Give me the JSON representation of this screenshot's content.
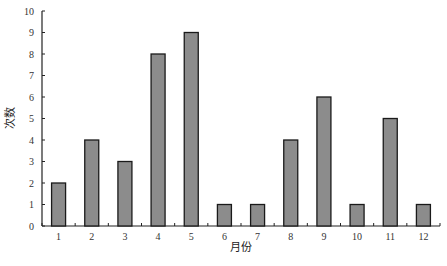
{
  "chart_data": {
    "type": "bar",
    "title": "",
    "xlabel": "月份",
    "ylabel": "次数",
    "categories": [
      "1",
      "2",
      "3",
      "4",
      "5",
      "6",
      "7",
      "8",
      "9",
      "10",
      "11",
      "12"
    ],
    "values": [
      2,
      4,
      3,
      8,
      9,
      1,
      1,
      4,
      6,
      1,
      5,
      1
    ],
    "ylim": [
      0,
      10
    ],
    "yticks": [
      0,
      1,
      2,
      3,
      4,
      5,
      6,
      7,
      8,
      9,
      10
    ],
    "grid": false,
    "legend": null,
    "bar_color": "#8c8c8c",
    "bar_edge_color": "#1a1a1a"
  }
}
